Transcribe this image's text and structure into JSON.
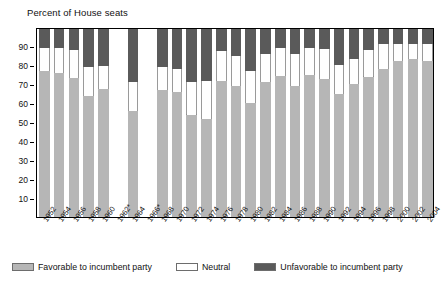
{
  "title": "Percent of House seats",
  "legend": {
    "items": [
      {
        "label": "Favorable to incumbent party",
        "swatch_name": "legend-swatch-favorable",
        "color": "#b6b6b6"
      },
      {
        "label": "Neutral",
        "swatch_name": "legend-swatch-neutral",
        "color": "#ffffff"
      },
      {
        "label": "Unfavorable to incumbent party",
        "swatch_name": "legend-swatch-unfavorable",
        "color": "#5a5a5a"
      }
    ]
  },
  "chart_data": {
    "type": "bar",
    "subtype": "stacked-column",
    "title": "Percent of House seats",
    "xlabel": "",
    "ylabel": "Percent of House seats",
    "ylim": [
      0,
      100
    ],
    "ytick_labels": [
      "90",
      "80",
      "70",
      "60",
      "50",
      "40",
      "30",
      "20",
      "10"
    ],
    "yticks": [
      90,
      80,
      70,
      60,
      50,
      40,
      30,
      20,
      10
    ],
    "grid": false,
    "legend_position": "bottom",
    "note": "Bars for 1962* and 1966* have no data (empty columns).",
    "categories": [
      "1952",
      "1954",
      "1956",
      "1958",
      "1960",
      "1962*",
      "1964",
      "1966*",
      "1968",
      "1970",
      "1972",
      "1974",
      "1976",
      "1978",
      "1980",
      "1982",
      "1984",
      "1986",
      "1988",
      "1990",
      "1992",
      "1994",
      "1996",
      "1998",
      "2000",
      "2002",
      "2004"
    ],
    "series": [
      {
        "name": "Favorable to incumbent party",
        "color": "#b6b6b6",
        "values": [
          78,
          77,
          74,
          65,
          68.5,
          null,
          57,
          null,
          68,
          67,
          55,
          52.5,
          72.5,
          70,
          61,
          72,
          75.5,
          70,
          76,
          73.5,
          66,
          71,
          75,
          79,
          83,
          84,
          83
        ]
      },
      {
        "name": "Neutral",
        "color": "#ffffff",
        "values": [
          12,
          13,
          15,
          15,
          12,
          null,
          15,
          null,
          12,
          12,
          17,
          20,
          16,
          16,
          17,
          15,
          14.5,
          17,
          14,
          16,
          15,
          13,
          14,
          13,
          9,
          8,
          9
        ]
      },
      {
        "name": "Unfavorable to incumbent party",
        "color": "#5a5a5a",
        "values": [
          10,
          10,
          11,
          20,
          19.5,
          null,
          28,
          null,
          20,
          21,
          28,
          27.5,
          11.5,
          14,
          22,
          13,
          10,
          13,
          10,
          10.5,
          19,
          16,
          11,
          8,
          8,
          8,
          8
        ]
      }
    ],
    "cumulative_tops": {
      "favorable": [
        78,
        77,
        74,
        65,
        68.5,
        null,
        57,
        null,
        68,
        67,
        55,
        52.5,
        72.5,
        70,
        61,
        72,
        75.5,
        70,
        76,
        73.5,
        66,
        71,
        75,
        79,
        83,
        84,
        83
      ],
      "neutral": [
        90,
        90,
        89,
        80,
        80.5,
        null,
        72,
        null,
        80,
        79,
        72,
        72.5,
        88.5,
        86,
        78,
        87,
        90,
        87,
        90,
        89.5,
        81,
        84,
        89,
        92,
        92,
        92,
        92
      ]
    }
  }
}
